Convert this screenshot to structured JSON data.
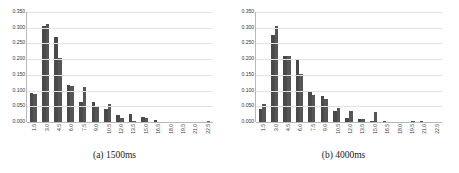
{
  "figure": {
    "background_color": "#ffffff",
    "bar_color": "#4a4a4a",
    "bar_color_secondary": "#565656",
    "gridline_color": "#e2e2e2",
    "axis_color": "#b9b9b9"
  },
  "panels": [
    {
      "id": "panel-a",
      "caption": "(a) 1500ms"
    },
    {
      "id": "panel-b",
      "caption": "(b) 4000ms"
    }
  ],
  "chart_data": [
    {
      "type": "bar",
      "title": "(a) 1500ms",
      "xlabel": "",
      "ylabel": "",
      "ylim": [
        0.0,
        0.35
      ],
      "grid": true,
      "legend": "none",
      "ytick_labels": [
        "0.350",
        "0.300",
        "0.250",
        "0.200",
        "0.150",
        "0.100",
        "0.050",
        "0.000"
      ],
      "ytick_values": [
        0.35,
        0.3,
        0.25,
        0.2,
        0.15,
        0.1,
        0.05,
        0.0
      ],
      "categories": [
        "1.5",
        "3.0",
        "4.5",
        "6.0",
        "7.5",
        "9.0",
        "10.5",
        "12.0",
        "13.5",
        "15.0",
        "16.5",
        "18.0",
        "19.5",
        "21.0",
        "22.5"
      ],
      "series": [
        {
          "name": "series-1",
          "values": [
            0.092,
            0.307,
            0.272,
            0.119,
            0.065,
            0.063,
            0.04,
            0.022,
            0.024,
            0.015,
            0.008,
            0.0,
            0.0,
            0.0,
            0.0
          ]
        },
        {
          "name": "series-2",
          "values": [
            0.089,
            0.311,
            0.204,
            0.114,
            0.11,
            0.05,
            0.057,
            0.013,
            0.003,
            0.014,
            0.0,
            0.0,
            0.0,
            0.0,
            0.004
          ]
        }
      ]
    },
    {
      "type": "bar",
      "title": "(b) 4000ms",
      "xlabel": "",
      "ylabel": "",
      "ylim": [
        0.0,
        0.35
      ],
      "grid": true,
      "legend": "none",
      "ytick_labels": [
        "0.350",
        "0.300",
        "0.250",
        "0.200",
        "0.150",
        "0.100",
        "0.050",
        "0.000"
      ],
      "ytick_values": [
        0.35,
        0.3,
        0.25,
        0.2,
        0.15,
        0.1,
        0.05,
        0.0
      ],
      "categories": [
        "1.5",
        "3.0",
        "4.5",
        "6.0",
        "7.5",
        "9.0",
        "10.5",
        "12.0",
        "13.5",
        "15.0",
        "16.5",
        "18.0",
        "19.5",
        "21.0",
        "22.5"
      ],
      "series": [
        {
          "name": "series-1",
          "values": [
            0.042,
            0.276,
            0.211,
            0.196,
            0.096,
            0.083,
            0.035,
            0.012,
            0.009,
            0.003,
            0.002,
            0.001,
            0.001,
            0.002,
            0.0
          ]
        },
        {
          "name": "series-2",
          "values": [
            0.058,
            0.305,
            0.211,
            0.153,
            0.087,
            0.073,
            0.046,
            0.036,
            0.011,
            0.033,
            0.001,
            0.001,
            0.002,
            0.001,
            0.0
          ]
        }
      ]
    }
  ]
}
